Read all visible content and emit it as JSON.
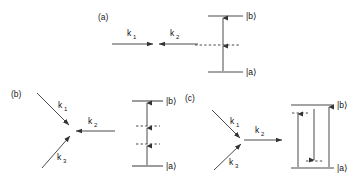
{
  "figure": {
    "background_color": "#ffffff",
    "line_color": "#4a4a4a",
    "arrow_color": "#333333",
    "text_color": "#111111",
    "width": 353,
    "height": 178
  },
  "panels": [
    {
      "id": "a",
      "label": "(a)",
      "wave_vectors": [
        {
          "name": "k1",
          "label": "k",
          "subscript": "1",
          "direction": "rightward, horizontal, incoming"
        },
        {
          "name": "k2",
          "label": "k",
          "subscript": "2",
          "direction": "leftward, horizontal, incoming"
        }
      ],
      "energy_levels": [
        {
          "name": "ground-state",
          "label": "|a⟩",
          "type": "solid"
        },
        {
          "name": "virtual-state",
          "label": "",
          "type": "dashed"
        },
        {
          "name": "excited-state",
          "label": "|b⟩",
          "type": "solid"
        }
      ],
      "transitions": [
        {
          "name": "absorption-1",
          "direction": "up"
        },
        {
          "name": "absorption-2",
          "direction": "up"
        }
      ]
    },
    {
      "id": "b",
      "label": "(b)",
      "wave_vectors": [
        {
          "name": "k1",
          "label": "k",
          "subscript": "1",
          "direction": "from upper-left, incoming"
        },
        {
          "name": "k2",
          "label": "k",
          "subscript": "2",
          "direction": "from right, incoming"
        },
        {
          "name": "k3",
          "label": "k",
          "subscript": "3",
          "direction": "from lower-left, incoming"
        }
      ],
      "energy_levels": [
        {
          "name": "ground-state",
          "label": "|a⟩",
          "type": "solid"
        },
        {
          "name": "virtual-state-lower",
          "label": "",
          "type": "dashed"
        },
        {
          "name": "virtual-state-upper",
          "label": "",
          "type": "dashed"
        },
        {
          "name": "excited-state",
          "label": "|b⟩",
          "type": "solid"
        }
      ],
      "transitions": [
        {
          "name": "absorption-1",
          "direction": "up"
        },
        {
          "name": "absorption-2",
          "direction": "up"
        },
        {
          "name": "absorption-3",
          "direction": "up"
        }
      ]
    },
    {
      "id": "c",
      "label": "(c)",
      "wave_vectors": [
        {
          "name": "k1",
          "label": "k",
          "subscript": "1",
          "direction": "from upper-left, incoming"
        },
        {
          "name": "k3",
          "label": "k",
          "subscript": "3",
          "direction": "from lower-left, incoming"
        },
        {
          "name": "k2",
          "label": "k",
          "subscript": "2",
          "direction": "to the right, outgoing"
        }
      ],
      "energy_levels": [
        {
          "name": "ground-state",
          "label": "|a⟩",
          "type": "solid"
        },
        {
          "name": "virtual-state-lower",
          "label": "",
          "type": "dashed"
        },
        {
          "name": "virtual-state-upper",
          "label": "",
          "type": "dashed"
        },
        {
          "name": "excited-state",
          "label": "|b⟩",
          "type": "solid"
        }
      ],
      "transitions": [
        {
          "name": "absorption-left",
          "direction": "up"
        },
        {
          "name": "emission-middle",
          "direction": "down"
        },
        {
          "name": "absorption-right",
          "direction": "up"
        }
      ]
    }
  ],
  "labels": {
    "panel_a": "(a)",
    "panel_b": "(b)",
    "panel_c": "(c)",
    "k_base": "k",
    "k1_sub": "1",
    "k2_sub": "2",
    "k3_sub": "3",
    "state_b": "|b⟩",
    "state_a": "|a⟩"
  }
}
